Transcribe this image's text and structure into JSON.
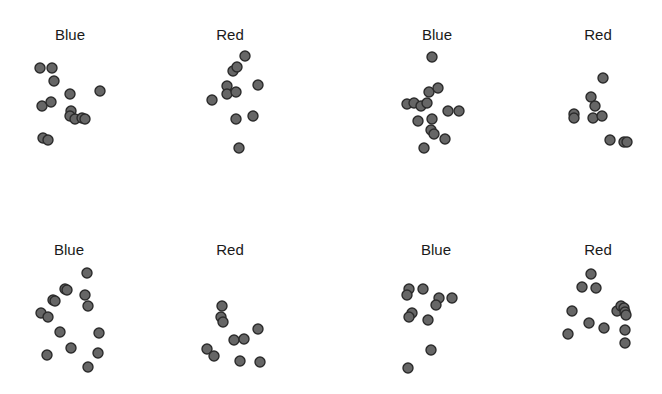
{
  "chart_data": {
    "type": "scatter",
    "layout": "2x4 grid of small-multiple dot panels, no axes, no gridlines, no legend",
    "panels": [
      {
        "title": "Blue",
        "title_x": 70,
        "title_y": 26,
        "points": [
          [
            40,
            68
          ],
          [
            52,
            68
          ],
          [
            54,
            81
          ],
          [
            70,
            94
          ],
          [
            100,
            91
          ],
          [
            42,
            106
          ],
          [
            51,
            102
          ],
          [
            71,
            111
          ],
          [
            70,
            116
          ],
          [
            75,
            119
          ],
          [
            82,
            118
          ],
          [
            85,
            119
          ],
          [
            43,
            138
          ],
          [
            48,
            140
          ]
        ]
      },
      {
        "title": "Red",
        "title_x": 230,
        "title_y": 26,
        "points": [
          [
            245,
            56
          ],
          [
            233,
            71
          ],
          [
            237,
            67
          ],
          [
            227,
            86
          ],
          [
            227,
            94
          ],
          [
            236,
            92
          ],
          [
            258,
            85
          ],
          [
            212,
            100
          ],
          [
            236,
            119
          ],
          [
            253,
            116
          ],
          [
            239,
            148
          ]
        ]
      },
      {
        "title": "Blue",
        "title_x": 437,
        "title_y": 26,
        "points": [
          [
            432,
            57
          ],
          [
            429,
            92
          ],
          [
            438,
            88
          ],
          [
            407,
            104
          ],
          [
            414,
            103
          ],
          [
            421,
            106
          ],
          [
            427,
            103
          ],
          [
            448,
            111
          ],
          [
            459,
            111
          ],
          [
            418,
            121
          ],
          [
            432,
            119
          ],
          [
            431,
            130
          ],
          [
            434,
            134
          ],
          [
            445,
            139
          ],
          [
            424,
            148
          ]
        ]
      },
      {
        "title": "Red",
        "title_x": 598,
        "title_y": 26,
        "points": [
          [
            603,
            78
          ],
          [
            591,
            97
          ],
          [
            595,
            106
          ],
          [
            574,
            114
          ],
          [
            574,
            118
          ],
          [
            593,
            118
          ],
          [
            602,
            116
          ],
          [
            610,
            140
          ],
          [
            624,
            142
          ],
          [
            627,
            142
          ]
        ]
      },
      {
        "title": "Blue",
        "title_x": 69,
        "title_y": 241,
        "points": [
          [
            87,
            273
          ],
          [
            65,
            289
          ],
          [
            67,
            290
          ],
          [
            53,
            300
          ],
          [
            55,
            301
          ],
          [
            85,
            295
          ],
          [
            88,
            306
          ],
          [
            41,
            313
          ],
          [
            48,
            317
          ],
          [
            60,
            332
          ],
          [
            99,
            333
          ],
          [
            71,
            348
          ],
          [
            47,
            355
          ],
          [
            98,
            353
          ],
          [
            88,
            367
          ]
        ]
      },
      {
        "title": "Red",
        "title_x": 230,
        "title_y": 241,
        "points": [
          [
            222,
            306
          ],
          [
            221,
            317
          ],
          [
            223,
            322
          ],
          [
            258,
            329
          ],
          [
            234,
            340
          ],
          [
            244,
            339
          ],
          [
            207,
            349
          ],
          [
            214,
            356
          ],
          [
            240,
            361
          ],
          [
            260,
            362
          ]
        ]
      },
      {
        "title": "Blue",
        "title_x": 436,
        "title_y": 241,
        "points": [
          [
            409,
            289
          ],
          [
            407,
            295
          ],
          [
            423,
            289
          ],
          [
            439,
            298
          ],
          [
            436,
            305
          ],
          [
            452,
            298
          ],
          [
            412,
            313
          ],
          [
            409,
            317
          ],
          [
            428,
            320
          ],
          [
            431,
            350
          ],
          [
            408,
            368
          ]
        ]
      },
      {
        "title": "Red",
        "title_x": 598,
        "title_y": 241,
        "points": [
          [
            591,
            274
          ],
          [
            582,
            287
          ],
          [
            596,
            288
          ],
          [
            572,
            311
          ],
          [
            617,
            311
          ],
          [
            621,
            306
          ],
          [
            624,
            308
          ],
          [
            625,
            312
          ],
          [
            626,
            315
          ],
          [
            589,
            323
          ],
          [
            604,
            328
          ],
          [
            625,
            330
          ],
          [
            568,
            334
          ],
          [
            625,
            343
          ]
        ]
      }
    ],
    "point_counts": [
      14,
      11,
      15,
      10,
      15,
      10,
      11,
      14
    ],
    "marker": {
      "shape": "circle",
      "radius": 5,
      "fill": "#666666",
      "stroke": "#2b2b2b"
    },
    "title": "",
    "xlabel": "",
    "ylabel": "",
    "grid": false,
    "legend": null
  }
}
